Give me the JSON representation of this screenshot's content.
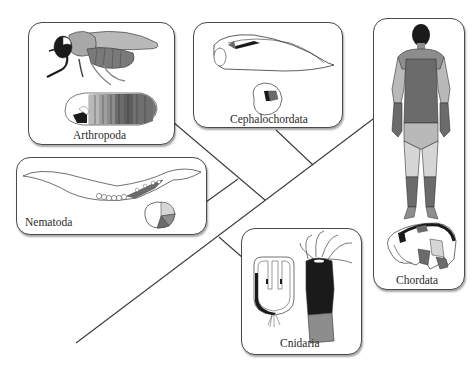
{
  "figure": {
    "type": "phylogenetic-tree",
    "taxa": [
      {
        "id": "arthropoda",
        "label": "Arthropoda",
        "illustrations": [
          "adult fly",
          "fly embryo/larva"
        ]
      },
      {
        "id": "cephalochordata",
        "label": "Cephalochordata",
        "illustrations": [
          "amphioxus adult",
          "amphioxus embryo"
        ]
      },
      {
        "id": "chordata",
        "label": "Chordata",
        "illustrations": [
          "human adult (back view)",
          "vertebrate embryo"
        ]
      },
      {
        "id": "nematoda",
        "label": "Nematoda",
        "illustrations": [
          "nematode worm",
          "nematode embryo"
        ]
      },
      {
        "id": "cnidaria",
        "label": "Cnidaria",
        "illustrations": [
          "cnidarian planula/polyp cross-section",
          "hydra polyp"
        ]
      }
    ],
    "colors": {
      "dark": "#1a1a1a",
      "mid_dark": "#6b6b6b",
      "mid": "#8d8d8d",
      "light": "#b9b9b9",
      "lighter": "#d6d6d6",
      "line": "#3a3a3a"
    }
  }
}
